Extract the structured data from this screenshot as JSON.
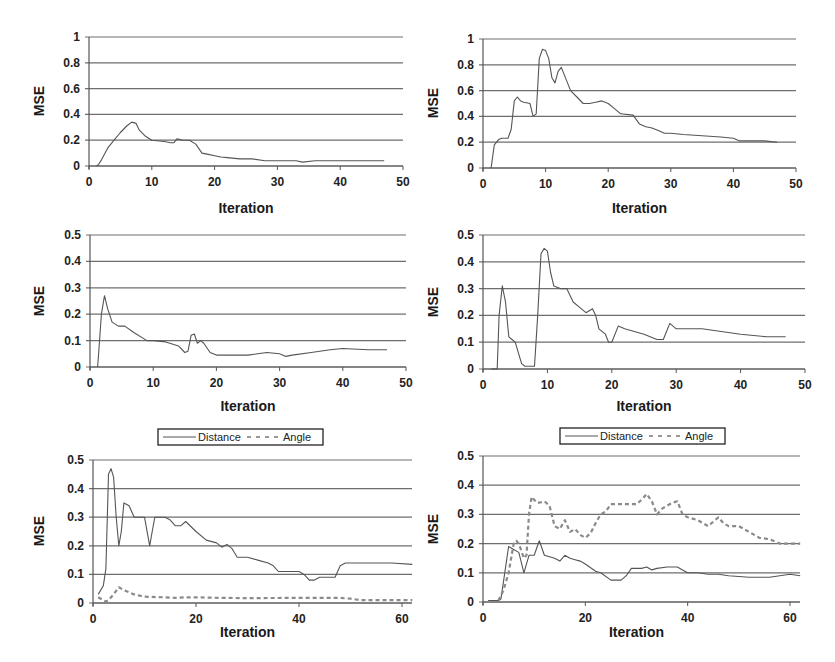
{
  "chart_data": [
    {
      "panel": "top-left",
      "type": "line",
      "xlabel": "Iteration",
      "ylabel": "MSE",
      "xlim": [
        0,
        50
      ],
      "ylim": [
        0,
        1
      ],
      "xticks": [
        "0",
        "10",
        "20",
        "30",
        "40",
        "50"
      ],
      "yticks": [
        "0",
        "0.2",
        "0.4",
        "0.6",
        "0.8",
        "1"
      ],
      "grid": "horizontal",
      "series": [
        {
          "name": "MSE",
          "style": "solid",
          "x": [
            1.2,
            1.5,
            2,
            3,
            4,
            5,
            6,
            6.8,
            7.5,
            8,
            9,
            10,
            12,
            13,
            13.5,
            14,
            15,
            16,
            17,
            18,
            19,
            20,
            21,
            22,
            24,
            26,
            28,
            30,
            33,
            34,
            36,
            40,
            44,
            47
          ],
          "y": [
            0,
            0.01,
            0.05,
            0.14,
            0.2,
            0.26,
            0.31,
            0.34,
            0.33,
            0.28,
            0.23,
            0.2,
            0.19,
            0.18,
            0.18,
            0.21,
            0.2,
            0.2,
            0.17,
            0.1,
            0.09,
            0.08,
            0.07,
            0.065,
            0.055,
            0.055,
            0.04,
            0.04,
            0.04,
            0.03,
            0.04,
            0.04,
            0.04,
            0.04
          ]
        }
      ]
    },
    {
      "panel": "top-right",
      "type": "line",
      "xlabel": "Iteration",
      "ylabel": "MSE",
      "xlim": [
        0,
        50
      ],
      "ylim": [
        0,
        1
      ],
      "xticks": [
        "0",
        "10",
        "20",
        "30",
        "40",
        "50"
      ],
      "yticks": [
        "0",
        "0.2",
        "0.4",
        "0.6",
        "0.8",
        "1"
      ],
      "grid": "horizontal",
      "series": [
        {
          "name": "MSE",
          "style": "solid",
          "x": [
            1.3,
            1.8,
            2.5,
            3,
            4,
            4.5,
            5,
            5.5,
            6,
            6.5,
            7.5,
            8,
            8.5,
            9,
            9.5,
            10,
            10.5,
            11,
            11.5,
            12,
            12.5,
            13,
            14,
            15,
            16,
            17,
            18,
            19,
            20,
            21,
            22,
            24,
            25,
            26,
            27,
            28,
            29,
            30,
            32,
            35,
            38,
            40,
            41,
            45,
            47
          ],
          "y": [
            0,
            0.18,
            0.22,
            0.23,
            0.23,
            0.3,
            0.52,
            0.55,
            0.52,
            0.51,
            0.5,
            0.4,
            0.42,
            0.85,
            0.92,
            0.91,
            0.85,
            0.7,
            0.66,
            0.75,
            0.78,
            0.72,
            0.6,
            0.55,
            0.5,
            0.5,
            0.51,
            0.52,
            0.5,
            0.46,
            0.42,
            0.41,
            0.34,
            0.32,
            0.31,
            0.29,
            0.27,
            0.27,
            0.26,
            0.25,
            0.24,
            0.23,
            0.21,
            0.21,
            0.2
          ]
        }
      ]
    },
    {
      "panel": "middle-left",
      "type": "line",
      "xlabel": "Iteration",
      "ylabel": "MSE",
      "xlim": [
        0,
        50
      ],
      "ylim": [
        0,
        0.5
      ],
      "xticks": [
        "0",
        "10",
        "20",
        "30",
        "40",
        "50"
      ],
      "yticks": [
        "0",
        "0.1",
        "0.2",
        "0.3",
        "0.4",
        "0.5"
      ],
      "grid": "horizontal",
      "series": [
        {
          "name": "MSE",
          "style": "solid",
          "x": [
            1.2,
            1.4,
            1.8,
            2.3,
            2.8,
            3.5,
            4.5,
            5.5,
            7,
            9,
            10,
            12,
            14,
            15,
            15.5,
            16,
            16.5,
            17,
            17.5,
            18,
            19,
            20,
            21,
            25,
            28,
            30,
            31,
            32,
            35,
            38,
            40,
            44,
            47
          ],
          "y": [
            0,
            0.06,
            0.2,
            0.27,
            0.22,
            0.17,
            0.155,
            0.155,
            0.13,
            0.1,
            0.1,
            0.095,
            0.08,
            0.055,
            0.06,
            0.12,
            0.125,
            0.09,
            0.1,
            0.09,
            0.055,
            0.045,
            0.045,
            0.045,
            0.055,
            0.05,
            0.04,
            0.045,
            0.055,
            0.065,
            0.07,
            0.065,
            0.065
          ]
        }
      ]
    },
    {
      "panel": "middle-right",
      "type": "line",
      "xlabel": "Iteration",
      "ylabel": "MSE",
      "xlim": [
        0,
        50
      ],
      "ylim": [
        0,
        0.5
      ],
      "xticks": [
        "0",
        "10",
        "20",
        "30",
        "40",
        "50"
      ],
      "yticks": [
        "0",
        "0.1",
        "0.2",
        "0.3",
        "0.4",
        "0.5"
      ],
      "grid": "horizontal",
      "series": [
        {
          "name": "MSE",
          "style": "solid",
          "x": [
            1.3,
            2.2,
            2.5,
            3,
            3.5,
            4,
            4.5,
            5,
            5.5,
            6,
            6.5,
            7,
            8,
            8.5,
            9,
            9.5,
            10,
            10.5,
            11,
            12,
            13,
            14,
            15,
            16,
            17,
            17.5,
            18,
            19,
            19.5,
            20,
            21,
            22,
            25,
            27,
            28,
            29,
            30,
            34,
            40,
            44,
            47
          ],
          "y": [
            0,
            0,
            0.2,
            0.31,
            0.25,
            0.12,
            0.11,
            0.1,
            0.06,
            0.02,
            0.01,
            0.01,
            0.01,
            0.2,
            0.43,
            0.45,
            0.44,
            0.36,
            0.31,
            0.3,
            0.3,
            0.25,
            0.23,
            0.21,
            0.225,
            0.2,
            0.15,
            0.13,
            0.1,
            0.1,
            0.16,
            0.15,
            0.13,
            0.11,
            0.11,
            0.17,
            0.15,
            0.15,
            0.13,
            0.12,
            0.12
          ]
        }
      ]
    },
    {
      "panel": "bottom-left",
      "type": "line",
      "xlabel": "Iteration",
      "ylabel": "MSE",
      "xlim": [
        0,
        62
      ],
      "ylim": [
        0,
        0.5
      ],
      "xticks": [
        "0",
        "20",
        "40",
        "60"
      ],
      "yticks": [
        "0",
        "0.1",
        "0.2",
        "0.3",
        "0.4",
        "0.5"
      ],
      "grid": "horizontal",
      "legend": {
        "position": "top",
        "entries": [
          "Distance",
          "Angle"
        ]
      },
      "series": [
        {
          "name": "Distance",
          "style": "solid",
          "x": [
            1,
            2,
            2.5,
            3,
            3.5,
            4,
            4.5,
            5,
            5.5,
            6,
            7,
            8,
            10,
            11,
            11.5,
            12,
            14,
            15,
            16,
            17,
            18,
            20,
            22,
            24,
            25,
            26,
            27,
            28,
            30,
            32,
            34,
            35,
            36,
            37,
            38,
            40,
            41,
            42,
            43,
            44,
            46,
            47,
            48,
            49,
            52,
            55,
            58,
            62
          ],
          "y": [
            0.03,
            0.06,
            0.12,
            0.45,
            0.47,
            0.44,
            0.3,
            0.2,
            0.25,
            0.35,
            0.34,
            0.3,
            0.3,
            0.2,
            0.25,
            0.3,
            0.3,
            0.29,
            0.27,
            0.27,
            0.285,
            0.25,
            0.22,
            0.21,
            0.195,
            0.205,
            0.19,
            0.16,
            0.16,
            0.15,
            0.14,
            0.13,
            0.11,
            0.11,
            0.11,
            0.11,
            0.1,
            0.08,
            0.08,
            0.09,
            0.09,
            0.09,
            0.13,
            0.14,
            0.14,
            0.14,
            0.14,
            0.135
          ]
        },
        {
          "name": "Angle",
          "style": "dashed",
          "x": [
            1,
            2,
            2.5,
            3,
            4,
            5,
            6,
            8,
            10,
            14,
            16,
            18,
            20,
            25,
            30,
            40,
            48,
            50,
            52,
            56,
            62
          ],
          "y": [
            0.02,
            0.01,
            0.005,
            0.01,
            0.03,
            0.055,
            0.045,
            0.03,
            0.022,
            0.02,
            0.018,
            0.02,
            0.02,
            0.018,
            0.017,
            0.018,
            0.018,
            0.015,
            0.01,
            0.01,
            0.01
          ]
        }
      ]
    },
    {
      "panel": "bottom-right",
      "type": "line",
      "xlabel": "Iteration",
      "ylabel": "MSE",
      "xlim": [
        0,
        62
      ],
      "ylim": [
        0,
        0.5
      ],
      "xticks": [
        "0",
        "20",
        "40",
        "60"
      ],
      "yticks": [
        "0",
        "0.1",
        "0.2",
        "0.3",
        "0.4",
        "0.5"
      ],
      "grid": "horizontal",
      "legend": {
        "position": "top",
        "entries": [
          "Distance",
          "Angle"
        ]
      },
      "series": [
        {
          "name": "Distance",
          "style": "solid",
          "x": [
            1,
            3,
            3.5,
            4,
            5,
            6,
            7,
            8,
            9,
            10,
            11,
            12,
            14,
            15,
            16,
            17,
            18,
            19,
            20,
            22,
            23,
            25,
            27,
            28,
            29,
            31,
            32,
            33,
            34,
            36,
            38,
            39,
            40,
            42,
            44,
            46,
            48,
            52,
            56,
            58,
            60,
            62
          ],
          "y": [
            0.005,
            0.005,
            0.01,
            0.07,
            0.19,
            0.18,
            0.17,
            0.1,
            0.16,
            0.16,
            0.21,
            0.16,
            0.15,
            0.14,
            0.16,
            0.15,
            0.145,
            0.14,
            0.13,
            0.105,
            0.1,
            0.075,
            0.075,
            0.09,
            0.115,
            0.115,
            0.12,
            0.11,
            0.115,
            0.12,
            0.12,
            0.11,
            0.1,
            0.1,
            0.095,
            0.095,
            0.09,
            0.085,
            0.085,
            0.09,
            0.095,
            0.09
          ]
        },
        {
          "name": "Angle",
          "style": "dashed",
          "x": [
            3,
            4,
            5,
            6,
            6.5,
            7,
            8,
            8.5,
            9,
            9.5,
            10,
            10.5,
            11,
            12,
            13,
            14,
            15,
            16,
            17,
            18,
            19,
            20,
            21,
            22,
            23,
            24,
            25,
            28,
            30,
            31,
            32,
            33,
            34,
            35,
            37,
            38,
            39,
            40,
            42,
            44,
            46,
            47,
            48,
            50,
            52,
            54,
            56,
            58,
            60,
            62
          ],
          "y": [
            0.005,
            0.04,
            0.1,
            0.2,
            0.21,
            0.2,
            0.15,
            0.16,
            0.3,
            0.36,
            0.35,
            0.34,
            0.34,
            0.345,
            0.33,
            0.26,
            0.25,
            0.28,
            0.24,
            0.25,
            0.23,
            0.22,
            0.235,
            0.27,
            0.3,
            0.31,
            0.335,
            0.335,
            0.335,
            0.35,
            0.37,
            0.345,
            0.3,
            0.32,
            0.34,
            0.345,
            0.3,
            0.29,
            0.28,
            0.26,
            0.29,
            0.27,
            0.26,
            0.26,
            0.24,
            0.22,
            0.215,
            0.2,
            0.2,
            0.2
          ]
        }
      ]
    }
  ]
}
